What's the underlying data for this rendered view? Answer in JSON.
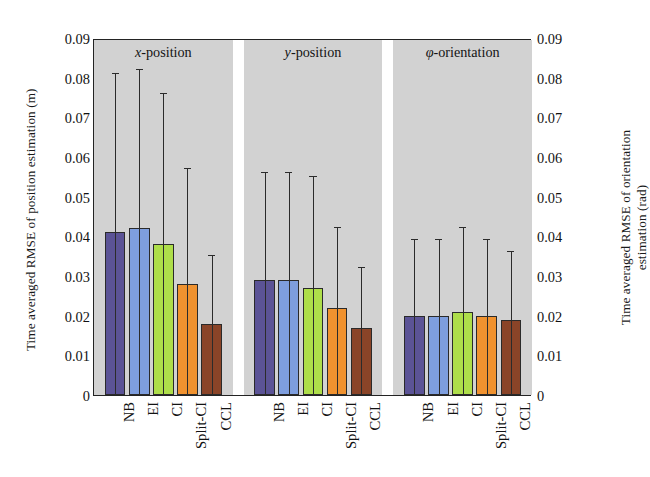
{
  "figure": {
    "left_axis_title": "Time averaged RMSE of position estimation (m)",
    "right_axis_title_line1": "Time averaged RMSE of orientation",
    "right_axis_title_line2": "estimation (rad)",
    "tick_labels": [
      "0.09",
      "0.08",
      "0.07",
      "0.06",
      "0.05",
      "0.04",
      "0.03",
      "0.02",
      "0.01",
      "0"
    ]
  },
  "chart_data": {
    "type": "bar",
    "title": "",
    "subtitle": "",
    "xlabel": "",
    "ylabel": "Time averaged RMSE of position estimation (m)",
    "y2label": "Time averaged RMSE of orientation estimation (rad)",
    "ylim": [
      0,
      0.09
    ],
    "y2lim": [
      0,
      0.09
    ],
    "ytick_values": [
      0,
      0.01,
      0.02,
      0.03,
      0.04,
      0.05,
      0.06,
      0.07,
      0.08,
      0.09
    ],
    "ytick_labels": [
      "0",
      "0.01",
      "0.02",
      "0.03",
      "0.04",
      "0.05",
      "0.06",
      "0.07",
      "0.08",
      "0.09"
    ],
    "grid": false,
    "legend": "none",
    "error_bars": "upper-only",
    "panel_background": "#d2d2d2",
    "categories": [
      "NB",
      "EI",
      "CI",
      "Split-CI",
      "CCL"
    ],
    "category_colors": [
      "#5b5396",
      "#7e9ede",
      "#aede4a",
      "#f0922f",
      "#8a4428"
    ],
    "groups": [
      {
        "name": "x-position",
        "label_html": "x-position",
        "axis": "left",
        "values": [
          0.041,
          0.042,
          0.038,
          0.028,
          0.018
        ],
        "error_upper": [
          0.081,
          0.082,
          0.076,
          0.057,
          0.035
        ]
      },
      {
        "name": "y-position",
        "label_html": "y-position",
        "axis": "left",
        "values": [
          0.029,
          0.029,
          0.027,
          0.022,
          0.017
        ],
        "error_upper": [
          0.056,
          0.056,
          0.055,
          0.042,
          0.032
        ]
      },
      {
        "name": "phi-orientation",
        "label_html": "φ-orientation",
        "axis": "right",
        "values": [
          0.02,
          0.02,
          0.021,
          0.02,
          0.019
        ],
        "error_upper": [
          0.039,
          0.039,
          0.042,
          0.039,
          0.036
        ]
      }
    ]
  }
}
